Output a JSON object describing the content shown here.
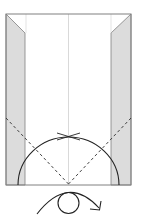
{
  "diagram": {
    "type": "origami-fold-diagram",
    "colors": {
      "paper": "#ffffff",
      "flap": "#dcdcdc",
      "outline": "#808080",
      "crease": "#c8c8c8",
      "fold_line": "#333333",
      "arrow": "#222222"
    },
    "elements": [
      "paper-outline",
      "left-folded-flap",
      "right-folded-flap",
      "center-crease",
      "left-valley-fold-dashed",
      "right-valley-fold-dashed",
      "fold-arc",
      "pinch-mark",
      "turn-over-symbol"
    ]
  }
}
